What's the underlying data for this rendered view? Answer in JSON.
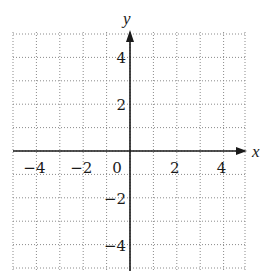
{
  "chart_data": {
    "type": "coordinate-grid",
    "title": "",
    "xlabel": "x",
    "ylabel": "y",
    "xlim": [
      -5,
      5
    ],
    "ylim": [
      -5,
      5
    ],
    "grid": true,
    "grid_style": "dotted",
    "grid_step": 1,
    "x_ticks": [
      -4,
      -2,
      0,
      2,
      4
    ],
    "y_ticks": [
      4,
      2,
      -2,
      -4
    ],
    "x_tick_labels": [
      "−4",
      "−2",
      "0",
      "2",
      "4"
    ],
    "y_tick_labels": [
      "4",
      "2",
      "−2",
      "−4"
    ],
    "series": []
  },
  "axes": {
    "x_label": "x",
    "y_label": "y",
    "origin_label": "0"
  },
  "colors": {
    "axis": "#1a1a1a",
    "grid": "#8a8a8a",
    "background": "#ffffff"
  }
}
